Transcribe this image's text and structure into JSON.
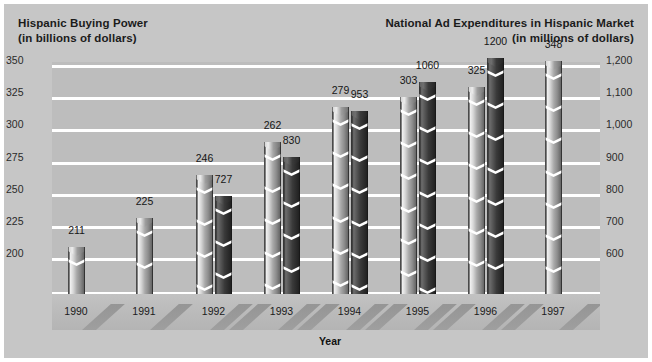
{
  "titles": {
    "left_line1": "Hispanic Buying Power",
    "left_line2": "(in billions of dollars)",
    "right_line1": "National Ad Expenditures in Hispanic Market",
    "right_line2": "(in millions of dollars)"
  },
  "axis": {
    "x_title": "Year",
    "left_ticks": [
      "350",
      "325",
      "300",
      "275",
      "250",
      "225",
      "200"
    ],
    "right_ticks": [
      "1,200",
      "1,100",
      "1,000",
      "900",
      "800",
      "700",
      "600"
    ]
  },
  "colors": {
    "background": "#c6c6c6",
    "plot_background": "#bdbdbd",
    "gridline": "#ffffff",
    "bar_light": "#d8d8d8",
    "bar_dark": "#3a3a3a",
    "text": "#1b1b1b"
  },
  "chart_data": {
    "type": "bar",
    "xlabel": "Year",
    "ylabel": "Hispanic Buying Power (in billions of dollars)",
    "y2label": "National Ad Expenditures in Hispanic Market (in millions of dollars)",
    "categories": [
      "1990",
      "1991",
      "1992",
      "1993",
      "1994",
      "1995",
      "1996",
      "1997"
    ],
    "grid": true,
    "legend": "none",
    "ylim": [
      175,
      362
    ],
    "y2lim": [
      500,
      1248
    ],
    "yticks": [
      200,
      225,
      250,
      275,
      300,
      325,
      350
    ],
    "y2ticks": [
      600,
      700,
      800,
      900,
      1000,
      1100,
      1200
    ],
    "series": [
      {
        "name": "Hispanic Buying Power (in billions of dollars)",
        "axis": "left",
        "values": [
          211,
          225,
          246,
          262,
          279,
          303,
          325,
          348
        ],
        "labels": [
          "211",
          "225",
          "246",
          "262",
          "279",
          "303",
          "325",
          "348"
        ]
      },
      {
        "name": "National Ad Expenditures in Hispanic Market (in millions of dollars)",
        "axis": "right",
        "values": [
          null,
          null,
          727,
          830,
          953,
          1060,
          1200,
          null
        ],
        "labels": [
          "",
          "",
          "727",
          "830",
          "953",
          "1060",
          "1200",
          ""
        ]
      }
    ]
  },
  "bars": [
    {
      "year": "1990",
      "left_x": 16,
      "light": {
        "label": "211",
        "height": 47,
        "x": 16
      },
      "dark": null
    },
    {
      "year": "1991",
      "left_x": 84,
      "light": {
        "label": "225",
        "height": 76,
        "x": 84
      },
      "dark": null
    },
    {
      "year": "1992",
      "light": {
        "label": "246",
        "height": 119,
        "x": 144
      },
      "dark": {
        "label": "727",
        "height": 98,
        "x": 163
      }
    },
    {
      "year": "1993",
      "light": {
        "label": "262",
        "height": 152,
        "x": 212
      },
      "dark": {
        "label": "830",
        "height": 137,
        "x": 231
      }
    },
    {
      "year": "1994",
      "light": {
        "label": "279",
        "height": 187,
        "x": 280
      },
      "dark": {
        "label": "953",
        "height": 183,
        "x": 299
      }
    },
    {
      "year": "1995",
      "light": {
        "label": "303",
        "height": 197,
        "x": 348
      },
      "dark": {
        "label": "1060",
        "height": 212,
        "x": 367
      }
    },
    {
      "year": "1996",
      "light": {
        "label": "325",
        "height": 207,
        "x": 416
      },
      "dark": {
        "label": "1200",
        "height": 236,
        "x": 435
      }
    },
    {
      "year": "1997",
      "light": {
        "label": "348",
        "height": 233,
        "x": 493
      },
      "dark": null
    }
  ]
}
